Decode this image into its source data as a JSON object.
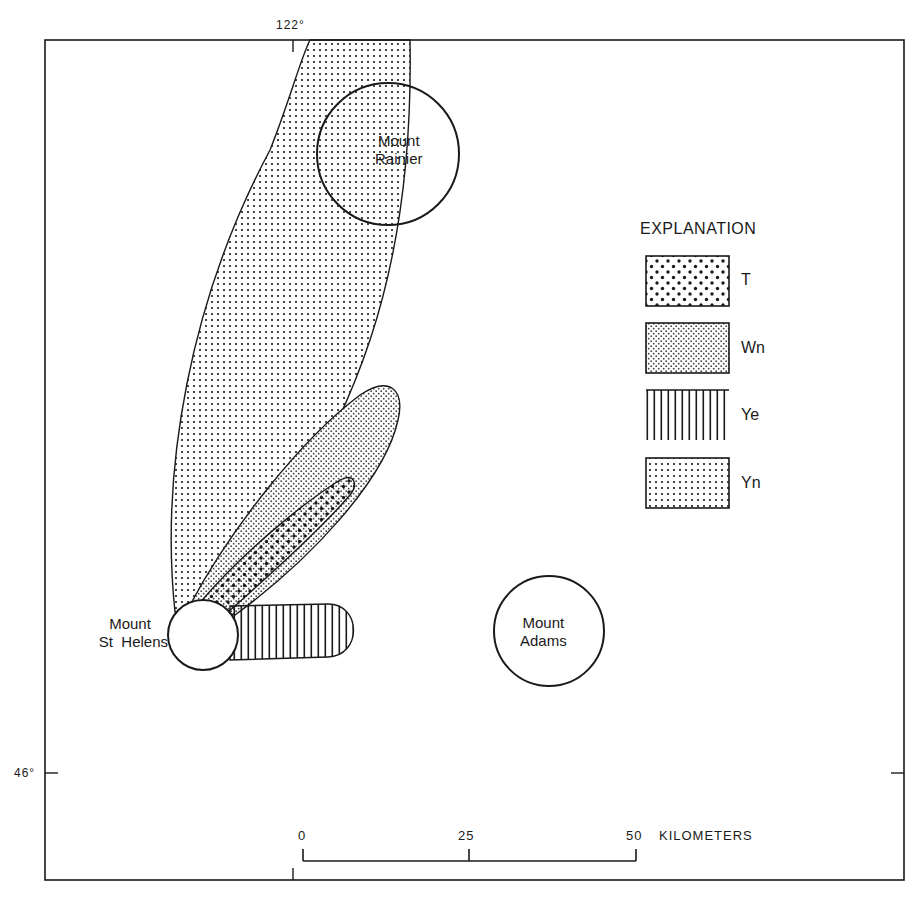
{
  "map": {
    "graticule": {
      "longitude_label": "122°",
      "latitude_label": "46°"
    },
    "places": {
      "rainier": {
        "line1": "Mount",
        "line2": "Rainier"
      },
      "st_helens": {
        "line1": "Mount",
        "line2": "St  Helens"
      },
      "adams": {
        "line1": "Mount",
        "line2": "Adams"
      }
    },
    "legend": {
      "title": "EXPLANATION",
      "items": [
        {
          "label": "T",
          "pattern": "coarse-dots"
        },
        {
          "label": "Wn",
          "pattern": "fine-dense-dots"
        },
        {
          "label": "Ye",
          "pattern": "vertical-lines"
        },
        {
          "label": "Yn",
          "pattern": "fine-grid-dots"
        }
      ]
    },
    "scale_bar": {
      "ticks": [
        "0",
        "25",
        "50"
      ],
      "unit": "KILOMETERS"
    },
    "colors": {
      "ink": "#1a1a1a",
      "paper": "#ffffff"
    }
  }
}
